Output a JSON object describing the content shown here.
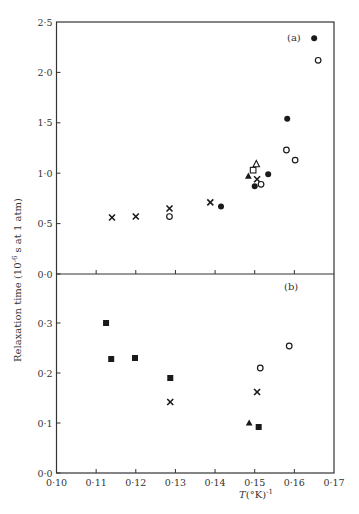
{
  "chart_data": {
    "type": "scatter",
    "title": "",
    "xlabel": "T(°K)^-1",
    "ylabel": "Relaxation time (10^-6 s at 1 atm)",
    "shared_x": true,
    "xlim": [
      0.1,
      0.17
    ],
    "xticks": [
      "0·10",
      "0·11",
      "0·12",
      "0·13",
      "0·14",
      "0·15",
      "0·16",
      "0·17"
    ],
    "grid": false,
    "legend": null,
    "panels": [
      {
        "label": "(a)",
        "ylim": [
          0.0,
          2.5
        ],
        "yticks": [
          "0·0",
          "0·5",
          "1·0",
          "1·5",
          "2·0",
          "2·5"
        ],
        "series": [
          {
            "name": "cross",
            "marker": "x",
            "x": [
              0.114,
              0.12,
              0.1285,
              0.1388,
              0.1506
            ],
            "y": [
              0.56,
              0.57,
              0.65,
              0.71,
              0.94
            ]
          },
          {
            "name": "open-circle",
            "marker": "o-open",
            "x": [
              0.1285,
              0.1516,
              0.158,
              0.1602,
              0.166
            ],
            "y": [
              0.57,
              0.89,
              1.23,
              1.13,
              2.12
            ]
          },
          {
            "name": "filled-circle",
            "marker": "o-filled",
            "x": [
              0.1415,
              0.15,
              0.1534,
              0.1582,
              0.165
            ],
            "y": [
              0.67,
              0.87,
              0.99,
              1.54,
              2.34
            ]
          },
          {
            "name": "filled-triangle",
            "marker": "triangle-filled",
            "x": [
              0.1484
            ],
            "y": [
              0.97
            ]
          },
          {
            "name": "open-triangle",
            "marker": "triangle-open",
            "x": [
              0.1504
            ],
            "y": [
              1.09
            ]
          },
          {
            "name": "open-square",
            "marker": "square-open",
            "x": [
              0.1496
            ],
            "y": [
              1.03
            ]
          }
        ]
      },
      {
        "label": "(b)",
        "ylim": [
          0.0,
          0.5
        ],
        "yticks": [
          "0·0",
          "0·1",
          "0·2",
          "0·3"
        ],
        "series": [
          {
            "name": "filled-square",
            "marker": "square-filled",
            "x": [
              0.1125,
              0.1138,
              0.1198,
              0.1287,
              0.151
            ],
            "y": [
              0.3,
              0.228,
              0.23,
              0.19,
              0.092
            ]
          },
          {
            "name": "cross",
            "marker": "x",
            "x": [
              0.1287,
              0.1506
            ],
            "y": [
              0.142,
              0.162
            ]
          },
          {
            "name": "open-circle",
            "marker": "o-open",
            "x": [
              0.1514,
              0.1587
            ],
            "y": [
              0.21,
              0.254
            ]
          },
          {
            "name": "filled-triangle",
            "marker": "triangle-filled",
            "x": [
              0.1486
            ],
            "y": [
              0.1
            ]
          }
        ]
      }
    ]
  }
}
